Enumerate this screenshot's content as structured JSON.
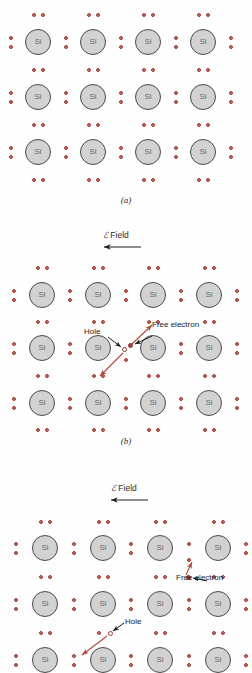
{
  "figure": {
    "atom_label": "Si",
    "colors": {
      "atom_fill": "#d2d2d2",
      "atom_stroke": "#4a4a4a",
      "atom_text": "#6a6a6a",
      "electron_fill": "#c86a62",
      "electron_stroke": "#9e3b33",
      "carrier_arrow": "#b04a3c",
      "label_arrow": "#1c1c1c",
      "background": "#fefefe"
    }
  },
  "panels": [
    {
      "id": "a",
      "caption": "(a)",
      "field_label": null,
      "columns": 4,
      "rows": 3,
      "annotations": []
    },
    {
      "id": "b",
      "caption": "(b)",
      "field_label": {
        "symbol": "ℰ",
        "text": " Field",
        "arrow_direction": "left"
      },
      "columns": 4,
      "rows": 3,
      "annotations": [
        {
          "name": "hole",
          "label": "Hole"
        },
        {
          "name": "free-electron",
          "label": "Free electron"
        }
      ]
    },
    {
      "id": "c",
      "caption": "(c)",
      "field_label": {
        "symbol": "ℰ",
        "text": " Field",
        "arrow_direction": "left"
      },
      "columns": 4,
      "rows": 3,
      "annotations": [
        {
          "name": "free-electron",
          "label": "Free electron"
        },
        {
          "name": "hole",
          "label": "Hole"
        }
      ]
    }
  ],
  "labels": {
    "caption_a": "(a)",
    "caption_b": "(b)",
    "caption_c": "(c)",
    "field_symbol": "ℰ",
    "field_text": " Field",
    "hole": "Hole",
    "free_electron": "Free electron",
    "si": "Si"
  }
}
